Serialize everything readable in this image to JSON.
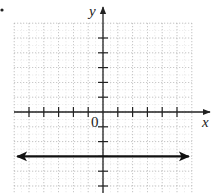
{
  "chart_data": {
    "type": "line",
    "title": "",
    "xlabel": "x",
    "ylabel": "y",
    "origin_label": "0",
    "xlim": [
      -6,
      6
    ],
    "ylim": [
      -5.5,
      6
    ],
    "grid": true,
    "grid_style": "dotted",
    "x_ticks": [
      -5,
      -4,
      -3,
      -2,
      -1,
      1,
      2,
      3,
      4,
      5
    ],
    "y_ticks": [
      -5,
      -4,
      -2,
      -1,
      1,
      2,
      3,
      4,
      5
    ],
    "series": [
      {
        "name": "y = -3",
        "equation": "y = -3",
        "x": [
          -6,
          6
        ],
        "y": [
          -3,
          -3
        ],
        "arrows": "both ends"
      }
    ],
    "colors": {
      "axis": "#222222",
      "grid": "#9a9a9a",
      "line": "#111111"
    },
    "marker_dot": {
      "description": "small bullet at top-left corner"
    }
  }
}
